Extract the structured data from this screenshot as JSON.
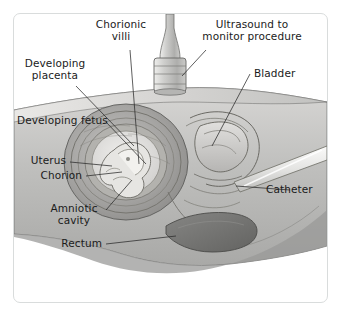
{
  "figure": {
    "style": "grayscale medical cross-section illustration",
    "frame_color": "#d9dcdc",
    "background_color": "#ffffff"
  },
  "labels": {
    "chorionic_villi": "Chorionic\nvilli",
    "ultrasound": "Ultrasound to\nmonitor procedure",
    "developing_placenta": "Developing\nplacenta",
    "developing_fetus": "Developing fetus",
    "uterus": "Uterus",
    "chorion": "Chorion",
    "amniotic_cavity": "Amniotic\ncavity",
    "rectum": "Rectum",
    "bladder": "Bladder",
    "catheter": "Catheter"
  },
  "structures": {
    "maternal_body": "maternal abdomen and pelvis in sagittal section",
    "transducer": "ultrasound transducer probe on abdominal wall",
    "catheter_tube": "catheter inserted from lower right",
    "fetus": "developing fetus within amniotic cavity",
    "rectum_organ": "rectum shown as dark shaded organ"
  },
  "colors": {
    "skin_light": "#e3e2e0",
    "body_mid": "#bcbcba",
    "body_dark": "#8e8e8c",
    "organ_dark": "#6f6f6d",
    "outline": "#555553",
    "leader_line": "#2a2a2a",
    "probe": "#c9c9c7",
    "catheter": "#e8e8e6"
  }
}
